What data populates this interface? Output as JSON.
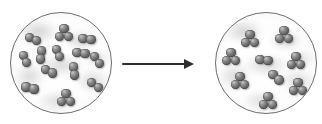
{
  "figure": {
    "type": "molecular-reaction-diagram",
    "title": "",
    "caption": "",
    "background_color": "#ffffff",
    "width": 322,
    "height": 124
  },
  "colors": {
    "atom_dark": "#3b3b3b",
    "atom_mid": "#6f6f6f",
    "atom_highlight": "#c9c9c9",
    "vessel_outline": "#6e6e6e",
    "vessel_fill": "#ffffff",
    "haze": "#969696",
    "arrow": "#2e2e2e"
  },
  "arrow": {
    "label": "reaction-arrow",
    "direction": "right",
    "x": 122,
    "y": 63,
    "length": 72,
    "annotation": ""
  },
  "vessels": [
    {
      "id": "reactants",
      "label": "Reactant mixture",
      "cx": 61,
      "cy": 63,
      "r": 51,
      "molecule_count": 13,
      "atom_radius": 4.6,
      "molecules": [
        {
          "name": "diatomic",
          "atoms": 2,
          "x": 22,
          "y": 26,
          "angle": 20
        },
        {
          "name": "triatomic",
          "atoms": 3,
          "x": 53,
          "y": 20,
          "angle": 0
        },
        {
          "name": "diatomic",
          "atoms": 2,
          "x": 76,
          "y": 26,
          "angle": 12
        },
        {
          "name": "diatomic",
          "atoms": 2,
          "x": 14,
          "y": 46,
          "angle": 72
        },
        {
          "name": "diatomic",
          "atoms": 2,
          "x": 47,
          "y": 40,
          "angle": 66
        },
        {
          "name": "diatomic",
          "atoms": 2,
          "x": 86,
          "y": 47,
          "angle": 58
        },
        {
          "name": "diatomic",
          "atoms": 2,
          "x": 38,
          "y": 58,
          "angle": 28
        },
        {
          "name": "diatomic",
          "atoms": 2,
          "x": 63,
          "y": 58,
          "angle": 78
        },
        {
          "name": "diatomic",
          "atoms": 2,
          "x": 19,
          "y": 75,
          "angle": 14
        },
        {
          "name": "diatomic",
          "atoms": 2,
          "x": 84,
          "y": 72,
          "angle": 36
        },
        {
          "name": "triatomic",
          "atoms": 3,
          "x": 55,
          "y": 85,
          "angle": 0
        },
        {
          "name": "diatomic",
          "atoms": 2,
          "x": 30,
          "y": 42,
          "angle": 100
        },
        {
          "name": "diatomic",
          "atoms": 2,
          "x": 70,
          "y": 40,
          "angle": 8
        }
      ]
    },
    {
      "id": "products",
      "label": "Product mixture",
      "cx": 266,
      "cy": 63,
      "r": 51,
      "molecule_count": 9,
      "atom_radius": 4.8,
      "molecules": [
        {
          "name": "triatomic",
          "atoms": 3,
          "x": 34,
          "y": 26,
          "angle": 0
        },
        {
          "name": "triatomic",
          "atoms": 3,
          "x": 68,
          "y": 22,
          "angle": 0
        },
        {
          "name": "triatomic",
          "atoms": 3,
          "x": 15,
          "y": 44,
          "angle": 0
        },
        {
          "name": "diatomic",
          "atoms": 2,
          "x": 48,
          "y": 47,
          "angle": 6
        },
        {
          "name": "triatomic",
          "atoms": 3,
          "x": 80,
          "y": 48,
          "angle": 0
        },
        {
          "name": "triatomic",
          "atoms": 3,
          "x": 24,
          "y": 68,
          "angle": 0
        },
        {
          "name": "triatomic",
          "atoms": 3,
          "x": 82,
          "y": 74,
          "angle": 0
        },
        {
          "name": "triatomic",
          "atoms": 3,
          "x": 52,
          "y": 88,
          "angle": 0
        },
        {
          "name": "diatomic",
          "atoms": 2,
          "x": 60,
          "y": 64,
          "angle": 40
        }
      ]
    }
  ]
}
